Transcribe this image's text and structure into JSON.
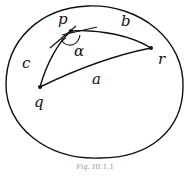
{
  "diagram": {
    "type": "spherical-triangle",
    "vertices": [
      {
        "name": "p",
        "label": "p"
      },
      {
        "name": "q",
        "label": "q"
      },
      {
        "name": "r",
        "label": "r"
      }
    ],
    "sides": [
      {
        "name": "a",
        "label": "a",
        "between": [
          "q",
          "r"
        ]
      },
      {
        "name": "b",
        "label": "b",
        "between": [
          "p",
          "r"
        ]
      },
      {
        "name": "c",
        "label": "c",
        "between": [
          "p",
          "q"
        ]
      }
    ],
    "angle": {
      "label": "α",
      "at": "p"
    },
    "caption": "Fig. III.1.1"
  }
}
